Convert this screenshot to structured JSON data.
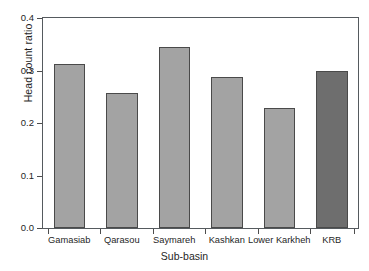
{
  "chart_data": {
    "type": "bar",
    "title": "",
    "xlabel": "Sub-basin",
    "ylabel": "Head count ratio",
    "categories": [
      "Gamasiab",
      "Qarasou",
      "Saymareh",
      "Kashkan",
      "Lower Karkheh",
      "KRB"
    ],
    "values": [
      0.312,
      0.258,
      0.344,
      0.288,
      0.229,
      0.3
    ],
    "ylim": [
      0.0,
      0.4
    ],
    "ytick_labels": [
      "0.0",
      "0.1",
      "0.2",
      "0.3",
      "0.4"
    ],
    "ytick_values": [
      0.0,
      0.1,
      0.2,
      0.3,
      0.4
    ],
    "grid": false,
    "legend": "none",
    "bar_colors": [
      "#a3a3a3",
      "#a3a3a3",
      "#a3a3a3",
      "#a3a3a3",
      "#a3a3a3",
      "#6e6e6e"
    ],
    "bar_edge_color": "#4a4a4a",
    "axis_color": "#555a5e",
    "background": "#ffffff"
  }
}
